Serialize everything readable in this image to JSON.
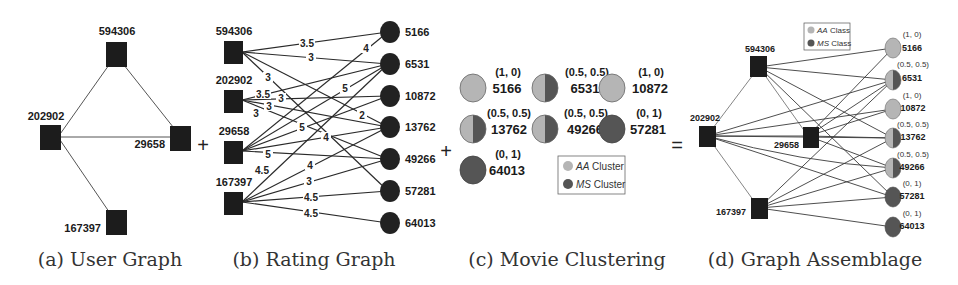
{
  "colors": {
    "user_node": "#1c1c1c",
    "movie_node_dark": "#222222",
    "aa_cluster": "#b5b5b5",
    "ms_cluster": "#555555",
    "edge": "#333333"
  },
  "operators": {
    "plus1": "+",
    "plus2": "+",
    "equals": "="
  },
  "panel_a": {
    "caption": "(a) User Graph",
    "users": [
      {
        "id": "594306"
      },
      {
        "id": "202902"
      },
      {
        "id": "29658"
      },
      {
        "id": "167397"
      }
    ],
    "edges": [
      [
        "594306",
        "202902"
      ],
      [
        "594306",
        "29658"
      ],
      [
        "202902",
        "29658"
      ],
      [
        "202902",
        "167397"
      ]
    ]
  },
  "panel_b": {
    "caption": "(b) Rating Graph",
    "users": [
      "594306",
      "202902",
      "29658",
      "167397"
    ],
    "movies": [
      "5166",
      "6531",
      "10872",
      "13762",
      "49266",
      "57281",
      "64013"
    ],
    "ratings": [
      {
        "user": "594306",
        "movie": "5166",
        "rating": "3.5"
      },
      {
        "user": "594306",
        "movie": "6531",
        "rating": "3"
      },
      {
        "user": "594306",
        "movie": "13762",
        "rating": "2"
      },
      {
        "user": "594306",
        "movie": "57281",
        "rating": "3"
      },
      {
        "user": "202902",
        "movie": "6531",
        "rating": "3.5"
      },
      {
        "user": "202902",
        "movie": "10872",
        "rating": "3"
      },
      {
        "user": "202902",
        "movie": "13762",
        "rating": "3"
      },
      {
        "user": "202902",
        "movie": "49266",
        "rating": "3"
      },
      {
        "user": "29658",
        "movie": "5166",
        "rating": "4"
      },
      {
        "user": "29658",
        "movie": "6531",
        "rating": "5"
      },
      {
        "user": "29658",
        "movie": "10872",
        "rating": "5"
      },
      {
        "user": "29658",
        "movie": "13762",
        "rating": "4"
      },
      {
        "user": "29658",
        "movie": "49266",
        "rating": "5"
      },
      {
        "user": "167397",
        "movie": "6531",
        "rating": "4.5"
      },
      {
        "user": "167397",
        "movie": "13762",
        "rating": "4"
      },
      {
        "user": "167397",
        "movie": "49266",
        "rating": "3"
      },
      {
        "user": "167397",
        "movie": "57281",
        "rating": "4.5"
      },
      {
        "user": "167397",
        "movie": "64013",
        "rating": "4.5"
      }
    ]
  },
  "panel_c": {
    "caption": "(c) Movie Clustering",
    "movies": [
      {
        "id": "5166",
        "membership": "(1, 0)",
        "aa": 1.0
      },
      {
        "id": "6531",
        "membership": "(0.5, 0.5)",
        "aa": 0.5
      },
      {
        "id": "10872",
        "membership": "(1, 0)",
        "aa": 1.0
      },
      {
        "id": "13762",
        "membership": "(0.5, 0.5)",
        "aa": 0.5
      },
      {
        "id": "49266",
        "membership": "(0.5, 0.5)",
        "aa": 0.5
      },
      {
        "id": "57281",
        "membership": "(0, 1)",
        "aa": 0.0
      },
      {
        "id": "64013",
        "membership": "(0, 1)",
        "aa": 0.0
      }
    ],
    "legend": {
      "aa_prefix": "AA",
      "aa_suffix": " Cluster",
      "ms_prefix": "MS",
      "ms_suffix": " Cluster"
    }
  },
  "panel_d": {
    "caption": "(d) Graph Assemblage",
    "legend": {
      "aa_prefix": "AA",
      "aa_suffix": " Class",
      "ms_prefix": "MS",
      "ms_suffix": " Class"
    },
    "users": [
      "594306",
      "202902",
      "29658",
      "167397"
    ],
    "movies": [
      {
        "id": "5166",
        "membership": "(1, 0)"
      },
      {
        "id": "6531",
        "membership": "(0.5, 0.5)"
      },
      {
        "id": "10872",
        "membership": "(1, 0)"
      },
      {
        "id": "13762",
        "membership": "(0.5, 0.5)"
      },
      {
        "id": "49266",
        "membership": "(0.5, 0.5)"
      },
      {
        "id": "57281",
        "membership": "(0, 1)"
      },
      {
        "id": "64013",
        "membership": "(0, 1)"
      }
    ]
  }
}
